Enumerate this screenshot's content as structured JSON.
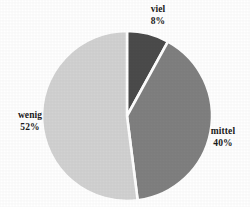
{
  "chart_data": {
    "type": "pie",
    "title": "",
    "subtitle": "",
    "xlabel": "",
    "ylabel": "",
    "legend_position": "none",
    "grid": false,
    "labels_outside": true,
    "start_angle_deg": 0,
    "direction": "clockwise",
    "categories": [
      "viel",
      "mittel",
      "wenig"
    ],
    "values": [
      8,
      40,
      52
    ],
    "value_unit": "%",
    "slices": [
      {
        "label": "viel",
        "value": 8,
        "value_text": "8%",
        "color": "#4b4b4b",
        "start_deg": 0,
        "end_deg": 28.8
      },
      {
        "label": "mittel",
        "value": 40,
        "value_text": "40%",
        "color": "#808080",
        "start_deg": 28.8,
        "end_deg": 172.8
      },
      {
        "label": "wenig",
        "value": 52,
        "value_text": "52%",
        "color": "#d2d2d2",
        "start_deg": 172.8,
        "end_deg": 360
      }
    ]
  },
  "colors": {
    "background": "#ffffff",
    "separator": "#ffffff",
    "text": "#1a1a1a",
    "slice_viel": "#4b4b4b",
    "slice_mittel": "#808080",
    "slice_wenig": "#d2d2d2"
  },
  "geometry": {
    "center_x": 127,
    "center_y": 116,
    "radius": 85
  },
  "labels": {
    "viel": {
      "name": "viel",
      "pct": "8%"
    },
    "mittel": {
      "name": "mittel",
      "pct": "40%"
    },
    "wenig": {
      "name": "wenig",
      "pct": "52%"
    }
  }
}
